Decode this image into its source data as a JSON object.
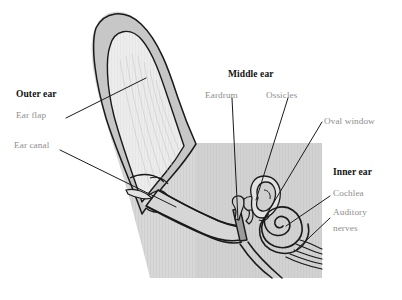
{
  "figure": {
    "background_color": "#ffffff",
    "head_fill": "#b9b9b9",
    "pinna_outer_fill": "#c9c9c9",
    "pinna_inner_fill": "#ececec",
    "outline_color": "#1a1a1a",
    "heading_color": "#111111",
    "sublabel_color": "#8e8e8e",
    "leader_color": "#1a1a1a"
  },
  "labels": {
    "outer_ear": {
      "heading": "Outer ear",
      "items": [
        {
          "name": "ear-flap",
          "text": "Ear flap"
        },
        {
          "name": "ear-canal",
          "text": "Ear canal"
        }
      ]
    },
    "middle_ear": {
      "heading": "Middle ear",
      "items": [
        {
          "name": "eardrum",
          "text": "Eardrum"
        },
        {
          "name": "ossicles",
          "text": "Ossicles"
        },
        {
          "name": "oval-window",
          "text": "Oval window"
        }
      ]
    },
    "inner_ear": {
      "heading": "Inner ear",
      "items": [
        {
          "name": "cochlea",
          "text": "Cochlea"
        },
        {
          "name": "auditory-nerves-line1",
          "text": "Auditory"
        },
        {
          "name": "auditory-nerves-line2",
          "text": "nerves"
        }
      ]
    }
  }
}
